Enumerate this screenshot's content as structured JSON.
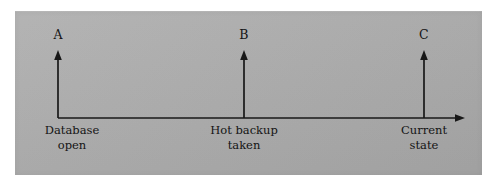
{
  "figure": {
    "kind": "timeline-diagram",
    "panel_color": "#adadad",
    "ink_color": "#181818",
    "background_color": "#ffffff"
  },
  "axis": {
    "name": "time-axis",
    "orientation": "horizontal",
    "direction": "left-to-right",
    "start_x": 58,
    "end_x": 465,
    "y": 118,
    "has_end_arrow": true
  },
  "events": [
    {
      "marker": "A",
      "x": 58,
      "arrow_top_y": 50,
      "caption_lines": [
        "Database",
        "open"
      ]
    },
    {
      "marker": "B",
      "x": 244,
      "arrow_top_y": 50,
      "caption_lines": [
        "Hot backup",
        "taken"
      ]
    },
    {
      "marker": "C",
      "x": 424,
      "arrow_top_y": 50,
      "caption_lines": [
        "Current",
        "state"
      ]
    }
  ]
}
